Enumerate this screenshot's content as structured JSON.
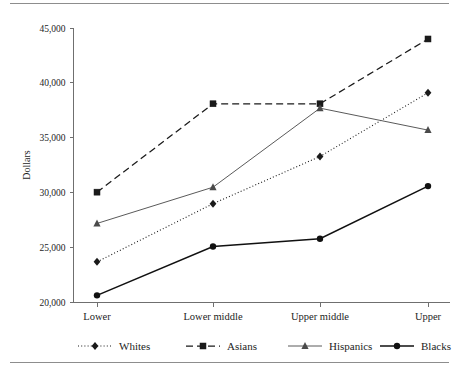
{
  "figure": {
    "top_rule": "horizontal-rule",
    "bottom_rule": "horizontal-rule"
  },
  "chart_data": {
    "type": "line",
    "title": "",
    "xlabel": "",
    "ylabel": "Dollars",
    "categories": [
      "Lower",
      "Lower middle",
      "Upper middle",
      "Upper"
    ],
    "ylim": [
      20000,
      45000
    ],
    "yticks": [
      20000,
      25000,
      30000,
      35000,
      40000,
      45000
    ],
    "ytick_labels": [
      "20,000",
      "25,000",
      "30,000",
      "35,000",
      "40,000",
      "45,000"
    ],
    "grid": false,
    "legend_position": "bottom",
    "series": [
      {
        "name": "Whites",
        "values": [
          23700,
          29000,
          33300,
          39100
        ],
        "line_style": "dotted",
        "marker": "diamond",
        "color": "#1a1a1a"
      },
      {
        "name": "Asians",
        "values": [
          30050,
          38100,
          38100,
          44000
        ],
        "line_style": "dashed",
        "marker": "square",
        "color": "#1a1a1a"
      },
      {
        "name": "Hispanics",
        "values": [
          27200,
          30500,
          37700,
          35700
        ],
        "line_style": "solid-thin",
        "marker": "triangle",
        "color": "#5a5a5a"
      },
      {
        "name": "Blacks",
        "values": [
          20650,
          25100,
          25800,
          30600
        ],
        "line_style": "solid-thick",
        "marker": "circle",
        "color": "#111111"
      }
    ]
  },
  "legend": {
    "items": [
      {
        "label": "Whites"
      },
      {
        "label": "Asians"
      },
      {
        "label": "Hispanics"
      },
      {
        "label": "Blacks"
      }
    ]
  }
}
